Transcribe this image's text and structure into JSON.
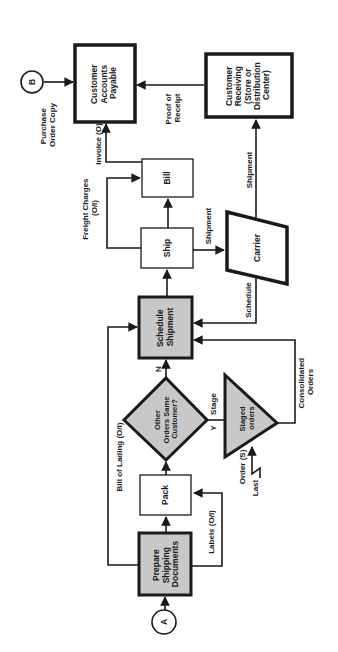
{
  "diagram": {
    "orientation": "rotated-90-ccw",
    "colors": {
      "background": "#ffffff",
      "stroke": "#1a1a1a",
      "shaded_fill": "#c8c8c8",
      "plain_fill": "#ffffff"
    },
    "connectors": {
      "A": "A",
      "B": "B"
    },
    "nodes": {
      "customer_ap": [
        "Customer",
        "Accounts",
        "Payable"
      ],
      "customer_receiving": [
        "Customer",
        "Receiving",
        "(Store or",
        "Distribution",
        "Center)"
      ],
      "bill": [
        "Bill"
      ],
      "ship": [
        "Ship"
      ],
      "carrier": [
        "Carrier"
      ],
      "schedule_shipment": [
        "Schedule",
        "Shipment"
      ],
      "decision": [
        "Other",
        "Orders Same",
        "Customer?"
      ],
      "staged_orders": [
        "Staged",
        "orders"
      ],
      "pack": [
        "Pack"
      ],
      "prepare_docs": [
        "Prepare",
        "Shipping",
        "Documents"
      ]
    },
    "edge_labels": {
      "purchase_order_copy": [
        "Purchase",
        "Order Copy"
      ],
      "proof_of_receipt": [
        "Proof of",
        "Receipt"
      ],
      "invoice": "Invoice (O)",
      "freight_charges": [
        "Freight Charges",
        "(O/I)"
      ],
      "shipment_ship_carrier": "Shipment",
      "shipment_carrier_receiving": "Shipment",
      "schedule": "Schedule",
      "n_label": "N",
      "y_label": "Y",
      "stage": "Stage",
      "consolidated_orders": [
        "Consolidated",
        "Orders"
      ],
      "order": "Order (S)",
      "last": "Last",
      "bill_of_lading": "Bill of Lading (O/I)",
      "labels": "Labels (O/I)"
    }
  }
}
